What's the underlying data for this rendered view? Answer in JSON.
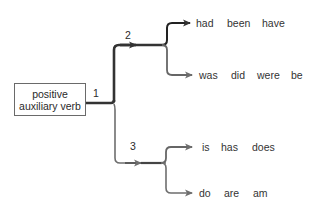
{
  "diagram": {
    "root": {
      "line1": "positive",
      "line2": "auxiliary verb"
    },
    "branch_labels": {
      "one": "1",
      "two": "2",
      "three": "3"
    },
    "groups": [
      {
        "id": "2a",
        "words": [
          "had",
          "been",
          "have"
        ]
      },
      {
        "id": "2b",
        "words": [
          "was",
          "did",
          "were",
          "be"
        ]
      },
      {
        "id": "3a",
        "words": [
          "is",
          "has",
          "does"
        ]
      },
      {
        "id": "3b",
        "words": [
          "do",
          "are",
          "am"
        ]
      }
    ],
    "colors": {
      "dark_line": "#333333",
      "light_line": "#6e6e6e",
      "box_border": "#6a6a6a"
    }
  }
}
